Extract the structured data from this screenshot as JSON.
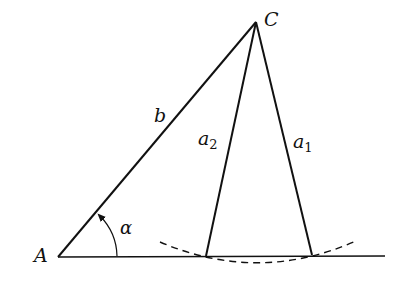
{
  "diagram": {
    "labels": {
      "vertex_a": "A",
      "vertex_c": "C",
      "side_b": "b",
      "side_a2_main": "a",
      "side_a2_sub": "2",
      "side_a1_main": "a",
      "side_a1_sub": "1",
      "angle": "α"
    },
    "points": {
      "A": [
        58,
        257
      ],
      "C": [
        256,
        22
      ],
      "B2": [
        206,
        256
      ],
      "B1": [
        312,
        255
      ],
      "baseline_end": [
        385,
        256
      ]
    },
    "colors": {
      "stroke": "#111111",
      "background": "#ffffff"
    }
  }
}
